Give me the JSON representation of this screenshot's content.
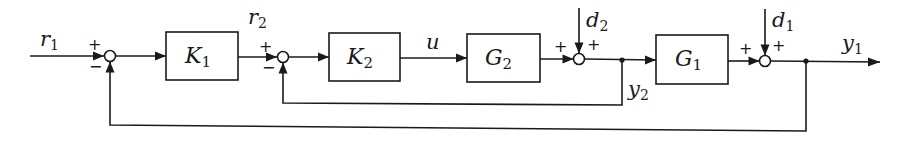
{
  "diagram": {
    "type": "cascade-control-block-diagram",
    "blocks": [
      {
        "id": "K1",
        "label": "K",
        "subscript": "1"
      },
      {
        "id": "K2",
        "label": "K",
        "subscript": "2"
      },
      {
        "id": "G2",
        "label": "G",
        "subscript": "2"
      },
      {
        "id": "G1",
        "label": "G",
        "subscript": "1"
      }
    ],
    "signals": {
      "r1": {
        "label": "r",
        "subscript": "1"
      },
      "r2": {
        "label": "r",
        "subscript": "2"
      },
      "u": {
        "label": "u",
        "subscript": ""
      },
      "d2": {
        "label": "d",
        "subscript": "2"
      },
      "y2": {
        "label": "y",
        "subscript": "2"
      },
      "d1": {
        "label": "d",
        "subscript": "1"
      },
      "y1": {
        "label": "y",
        "subscript": "1"
      }
    },
    "summing_junctions": [
      {
        "id": "S1",
        "signs": {
          "left": "+",
          "bottom": "−"
        }
      },
      {
        "id": "S2",
        "signs": {
          "left": "+",
          "bottom": "−"
        }
      },
      {
        "id": "S3",
        "signs": {
          "left": "+",
          "top": "+"
        }
      },
      {
        "id": "S4",
        "signs": {
          "left": "+",
          "top": "+"
        }
      }
    ],
    "connections": [
      "r1 -> S1(+)",
      "S1 -> K1",
      "K1 -> S2(+) as r2",
      "S2 -> K2",
      "K2 -> G2 as u",
      "G2 -> S3(+)",
      "d2 -> S3(+)",
      "S3 -> y2 junction",
      "y2 -> G1",
      "y2 -> S2(−) inner feedback",
      "G1 -> S4(+)",
      "d1 -> S4(+)",
      "S4 -> y1 output",
      "y1 -> S1(−) outer feedback"
    ]
  }
}
